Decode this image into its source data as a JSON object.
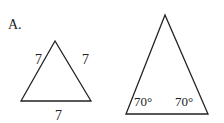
{
  "option_label": "A.",
  "figure1": {
    "shape": "equilateral triangle",
    "side_labels": [
      "7",
      "7",
      "7"
    ]
  },
  "figure2": {
    "shape": "isosceles triangle",
    "angle_labels": [
      "70°",
      "70°"
    ]
  },
  "colors": {
    "stroke": "#222222",
    "background": "#ffffff"
  }
}
